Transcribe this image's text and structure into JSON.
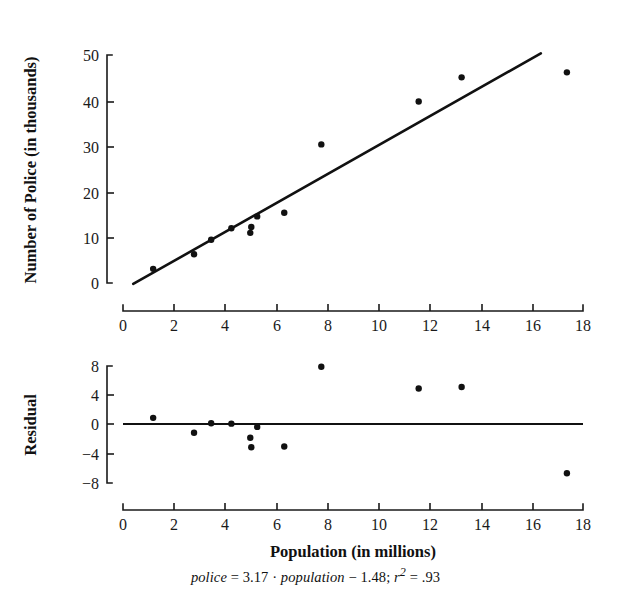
{
  "figure": {
    "caption": "police = 3.17 · population − 1.48; r2 = .93",
    "caption_parts": {
      "lead": "police",
      "eq1": " = ",
      "slope": "3.17",
      "dot": " · ",
      "var": "population",
      "minus": " − ",
      "intercept": "1.48",
      "semi": "; ",
      "r": "r",
      "sup": "2",
      "eq2": " = ",
      "rsq_value": ".93"
    }
  },
  "chart_data": [
    {
      "id": "scatter-regression",
      "type": "scatter",
      "title": "",
      "xlabel": "Population (in millions)",
      "ylabel": "Number of Police (in thousands)",
      "xlim": [
        0,
        18
      ],
      "ylim": [
        0,
        50
      ],
      "xticks": [
        0,
        2,
        4,
        6,
        8,
        10,
        12,
        14,
        16,
        18
      ],
      "yticks": [
        0,
        10,
        20,
        30,
        40,
        50
      ],
      "grid": false,
      "legend": "none",
      "x": [
        1.18,
        2.78,
        3.45,
        4.24,
        4.98,
        5.02,
        5.25,
        6.31,
        7.76,
        11.57,
        13.25,
        17.37
      ],
      "y": [
        3.1,
        6.3,
        9.5,
        12.0,
        11.0,
        12.3,
        14.6,
        15.4,
        30.4,
        39.8,
        45.1,
        46.2
      ],
      "fit_line": {
        "label": "least-squares regression line",
        "slope": 3.17,
        "intercept": -1.48,
        "x_start": 0.4,
        "x_end": 16.35
      }
    },
    {
      "id": "residual-plot",
      "type": "scatter",
      "title": "",
      "xlabel": "Population (in millions)",
      "ylabel": "Residual",
      "xlim": [
        0,
        18
      ],
      "ylim": [
        -9.5,
        9.5
      ],
      "xticks": [
        0,
        2,
        4,
        6,
        8,
        10,
        12,
        14,
        16,
        18
      ],
      "yticks": [
        -8,
        -4,
        0,
        4,
        8
      ],
      "ytick_labels": [
        "−8",
        "−4",
        "0",
        "4",
        "8"
      ],
      "grid": false,
      "legend": "none",
      "x": [
        1.18,
        2.78,
        3.45,
        4.24,
        4.98,
        5.02,
        5.25,
        6.31,
        7.76,
        11.57,
        13.25,
        17.37
      ],
      "y": [
        0.85,
        -1.2,
        0.1,
        0.05,
        -1.9,
        -3.2,
        -0.4,
        -3.1,
        7.9,
        4.9,
        5.1,
        -6.8
      ],
      "zero_reference_line": 0
    }
  ],
  "axes": {
    "top": {
      "y_axis_label": "Number of Police (in thousands)",
      "y_tick_labels": [
        "50",
        "40",
        "30",
        "20",
        "10",
        "0"
      ],
      "x_tick_labels": [
        "0",
        "2",
        "4",
        "6",
        "8",
        "10",
        "12",
        "14",
        "16",
        "18"
      ]
    },
    "bottom": {
      "y_axis_label": "Residual",
      "y_tick_labels": [
        "8",
        "4",
        "0",
        "−4",
        "−8"
      ],
      "x_tick_labels": [
        "0",
        "2",
        "4",
        "6",
        "8",
        "10",
        "12",
        "14",
        "16",
        "18"
      ],
      "x_axis_label": "Population (in millions)"
    }
  },
  "colors": {
    "ink": "#111111",
    "background": "#ffffff",
    "marker": "#111111",
    "fit_line": "#111111"
  }
}
